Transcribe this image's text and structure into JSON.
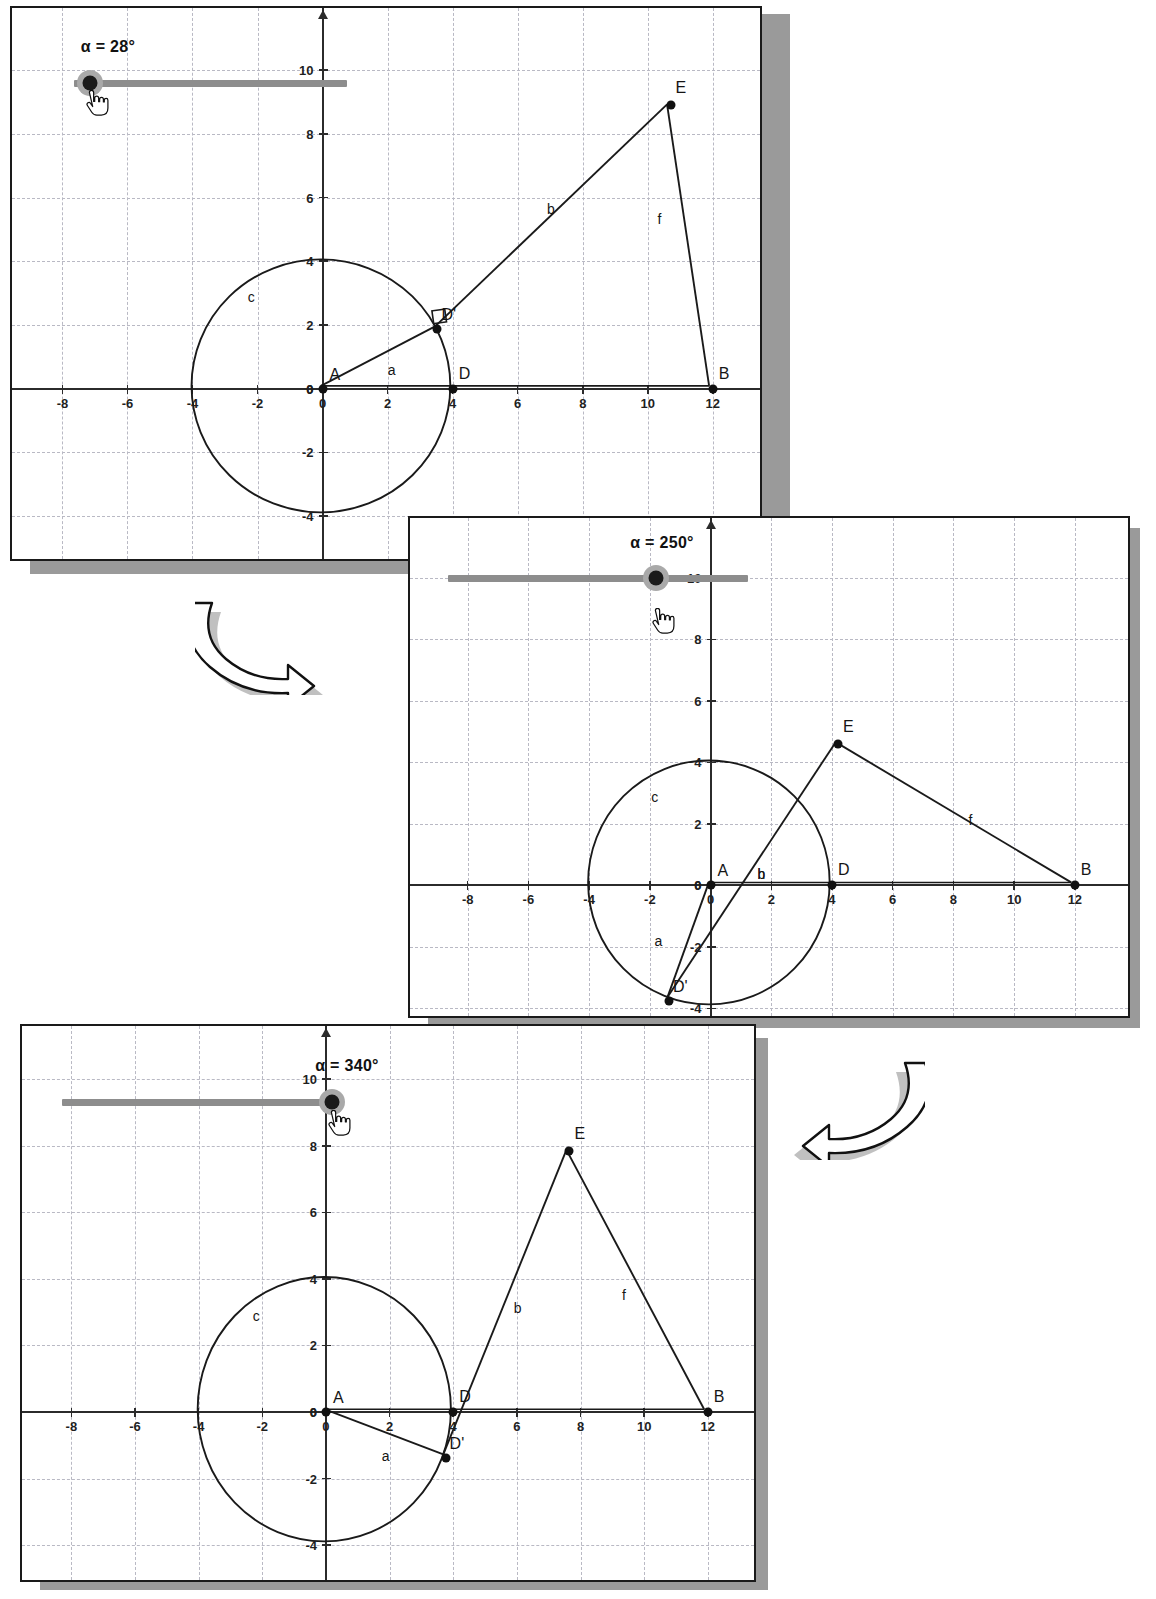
{
  "document": {
    "type": "geometry-software-screenshot-sequence",
    "panel_count": 3
  },
  "panels": [
    {
      "id": "panel-1",
      "slider": {
        "label": "α = 28°",
        "value_deg": 28,
        "min_deg": 0,
        "max_deg": 360,
        "handle_position": "left"
      },
      "axes": {
        "x_ticks": [
          "-8",
          "-6",
          "-4",
          "-2",
          "0",
          "2",
          "4",
          "6",
          "8",
          "10",
          "12"
        ],
        "y_ticks": [
          "10",
          "8",
          "6",
          "4",
          "2",
          "0",
          "-2",
          "-4"
        ],
        "origin_label": "0"
      },
      "points": [
        {
          "name": "A",
          "label": "A",
          "x": 0,
          "y": 0
        },
        {
          "name": "D",
          "label": "D",
          "x": 4,
          "y": 0
        },
        {
          "name": "Dprime",
          "label": "D'",
          "x": 3.53,
          "y": 1.88
        },
        {
          "name": "B",
          "label": "B",
          "x": 12,
          "y": 0
        },
        {
          "name": "E",
          "label": "E",
          "x": 10.7,
          "y": 8.9
        }
      ],
      "segments": [
        {
          "name": "a",
          "label": "a",
          "from": "A",
          "to": "Dprime",
          "label_x": 2.0,
          "label_y": 0.55
        },
        {
          "name": "b",
          "label": "b",
          "from": "Dprime",
          "to": "E",
          "label_x": 6.9,
          "label_y": 5.6
        },
        {
          "name": "f",
          "label": "f",
          "from": "E",
          "to": "B",
          "label_x": 10.3,
          "label_y": 5.3
        },
        {
          "name": "h",
          "label": "",
          "from": "A",
          "to": "B",
          "label_x": 0,
          "label_y": 0
        }
      ],
      "circle": {
        "name": "c",
        "label": "c",
        "cx": 0,
        "cy": 0,
        "r": 4,
        "label_x": -2.3,
        "label_y": 2.85
      },
      "right_angle_marker": {
        "at": "Dprime",
        "visible": true
      }
    },
    {
      "id": "panel-2",
      "slider": {
        "label": "α = 250°",
        "value_deg": 250,
        "min_deg": 0,
        "max_deg": 360,
        "handle_position": "center-right"
      },
      "axes": {
        "x_ticks": [
          "-8",
          "-6",
          "-4",
          "-2",
          "0",
          "2",
          "4",
          "6",
          "8",
          "10",
          "12"
        ],
        "y_ticks": [
          "10",
          "8",
          "6",
          "4",
          "2",
          "0",
          "-2",
          "-4"
        ],
        "origin_label": "0"
      },
      "points": [
        {
          "name": "A",
          "label": "A",
          "x": 0,
          "y": 0
        },
        {
          "name": "D",
          "label": "D",
          "x": 4,
          "y": 0
        },
        {
          "name": "Dprime",
          "label": "D'",
          "x": -1.37,
          "y": -3.76
        },
        {
          "name": "B",
          "label": "B",
          "x": 12,
          "y": 0
        },
        {
          "name": "E",
          "label": "E",
          "x": 4.2,
          "y": 4.6
        }
      ],
      "segments": [
        {
          "name": "a",
          "label": "a",
          "from": "A",
          "to": "Dprime",
          "label_x": -1.85,
          "label_y": -1.85
        },
        {
          "name": "b",
          "label": "b",
          "from": "Dprime",
          "to": "E",
          "label_x": 1.55,
          "label_y": 0.35
        },
        {
          "name": "f",
          "label": "f",
          "from": "E",
          "to": "B",
          "label_x": 8.5,
          "label_y": 2.1
        },
        {
          "name": "h",
          "label": "h",
          "from": "A",
          "to": "B",
          "label_x": 1.55,
          "label_y": 0.35
        }
      ],
      "circle": {
        "name": "c",
        "label": "c",
        "cx": 0,
        "cy": 0,
        "r": 4,
        "label_x": -1.95,
        "label_y": 2.85
      },
      "right_angle_marker": {
        "at": "Dprime",
        "visible": false
      }
    },
    {
      "id": "panel-3",
      "slider": {
        "label": "α = 340°",
        "value_deg": 340,
        "min_deg": 0,
        "max_deg": 360,
        "handle_position": "right"
      },
      "axes": {
        "x_ticks": [
          "-8",
          "-6",
          "-4",
          "-2",
          "0",
          "2",
          "4",
          "6",
          "8",
          "10",
          "12"
        ],
        "y_ticks": [
          "10",
          "8",
          "6",
          "4",
          "2",
          "0",
          "-2",
          "-4"
        ],
        "origin_label": "0"
      },
      "points": [
        {
          "name": "A",
          "label": "A",
          "x": 0,
          "y": 0
        },
        {
          "name": "D",
          "label": "D",
          "x": 4,
          "y": 0
        },
        {
          "name": "Dprime",
          "label": "D'",
          "x": 3.76,
          "y": -1.37
        },
        {
          "name": "B",
          "label": "B",
          "x": 12,
          "y": 0
        },
        {
          "name": "E",
          "label": "E",
          "x": 7.65,
          "y": 7.85
        }
      ],
      "segments": [
        {
          "name": "a",
          "label": "a",
          "from": "A",
          "to": "Dprime",
          "label_x": 1.75,
          "label_y": -1.35
        },
        {
          "name": "b",
          "label": "b",
          "from": "Dprime",
          "to": "E",
          "label_x": 5.9,
          "label_y": 3.1
        },
        {
          "name": "f",
          "label": "f",
          "from": "E",
          "to": "B",
          "label_x": 9.3,
          "label_y": 3.5
        },
        {
          "name": "h",
          "label": "",
          "from": "A",
          "to": "B",
          "label_x": 0,
          "label_y": 0
        }
      ],
      "circle": {
        "name": "c",
        "label": "c",
        "cx": 0,
        "cy": 0,
        "r": 4,
        "label_x": -2.3,
        "label_y": 2.85
      },
      "right_angle_marker": {
        "at": "Dprime",
        "visible": false
      }
    }
  ],
  "flow_arrows": [
    {
      "name": "arrow-panel1-to-panel2",
      "direction": "down-right"
    },
    {
      "name": "arrow-panel2-to-panel3",
      "direction": "down-left"
    }
  ],
  "colors": {
    "ink": "#1a1a1a",
    "grid": "#b9b9c4",
    "axis": "#2b2b2b",
    "slider_track": "#8d8d8d",
    "slider_halo": "#a9a9a9",
    "slider_knob": "#1a1a1a",
    "panel_shadow": "#9a9a9a",
    "page_background": "#ffffff"
  }
}
